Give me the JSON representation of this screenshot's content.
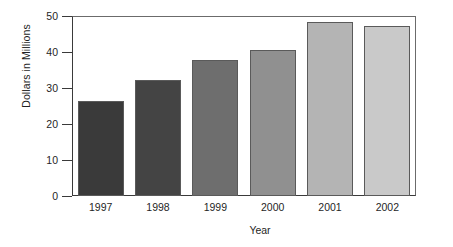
{
  "chart_data": {
    "type": "bar",
    "title": "",
    "xlabel": "Year",
    "ylabel": "Dollars in Millions",
    "categories": [
      "1997",
      "1998",
      "1999",
      "2000",
      "2001",
      "2002"
    ],
    "values": [
      26.4,
      32.2,
      37.8,
      40.5,
      48.3,
      47.2
    ],
    "series": [
      {
        "name": "Dollars in Millions",
        "values": [
          26.4,
          32.2,
          37.8,
          40.5,
          48.3,
          47.2
        ]
      }
    ],
    "ylim": [
      0,
      50
    ],
    "ytick_labels": [
      "0",
      "10",
      "20",
      "30",
      "40",
      "50"
    ],
    "ytick_values": [
      0,
      10,
      20,
      30,
      40,
      50
    ],
    "grid": false,
    "legend": "none",
    "bar_colors": [
      "#3a3a3a",
      "#444444",
      "#6e6e6e",
      "#909090",
      "#b4b4b4",
      "#c9c9c9"
    ],
    "bar_border_color": "#5a5a5a",
    "axis_color": "#3a3a3a",
    "background_color": "#ffffff",
    "text_color": "#1f1f1f"
  }
}
